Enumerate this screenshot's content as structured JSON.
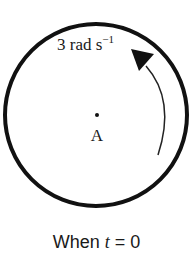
{
  "figure": {
    "angular_velocity_label": "3 rad s",
    "angular_velocity_exponent": "−1",
    "center_label": "A",
    "caption_prefix": "When ",
    "caption_variable": "t",
    "caption_suffix": " = 0",
    "rotation_direction": "counterclockwise",
    "colors": {
      "stroke": "#111111",
      "background": "#ffffff"
    }
  }
}
